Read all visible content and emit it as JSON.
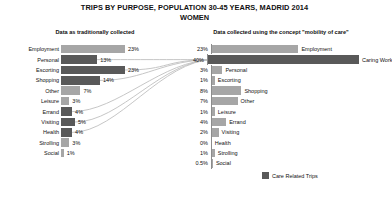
{
  "title": {
    "main": "TRIPS BY PURPOSE, POPULATION 30-45 YEARS, MADRID 2014",
    "sub": "WOMEN"
  },
  "panels": {
    "left_heading": "Data as traditionally collected",
    "right_heading": "Data collected using the concept \"mobility of care\""
  },
  "legend": {
    "label": "Care Related Trips",
    "swatch_color": "#595959"
  },
  "colors": {
    "regular": "#a6a6a6",
    "care": "#595959",
    "connector": "#bfbfbf",
    "axis": "#8c8c8c"
  },
  "chart_data": {
    "type": "bar",
    "xlabel": "",
    "ylabel": "",
    "xlim": [
      0,
      40
    ],
    "grid": false,
    "legend_position": "bottom-right",
    "panels": [
      {
        "name": "Data as traditionally collected",
        "orientation": "horizontal-bar",
        "label_side": "left",
        "categories": [
          "Employment",
          "Personal",
          "Escorting",
          "Shopping",
          "Other",
          "Leisure",
          "Errand",
          "Visiting",
          "Health",
          "Strolling",
          "Social"
        ],
        "values": [
          23,
          13,
          23,
          14,
          7,
          3,
          4,
          5,
          4,
          3,
          1
        ],
        "value_labels": [
          "23%",
          "13%",
          "23%",
          "14%",
          "7%",
          "3%",
          "4%",
          "5%",
          "4%",
          "3%",
          "1%"
        ],
        "care_related": [
          false,
          true,
          true,
          true,
          false,
          false,
          true,
          true,
          true,
          false,
          false
        ]
      },
      {
        "name": "Data collected using the concept \"mobility of care\"",
        "orientation": "horizontal-bar",
        "label_side": "right",
        "categories": [
          "Employment",
          "Caring Work",
          "Personal",
          "Escorting",
          "Shopping",
          "Other",
          "Leisure",
          "Errand",
          "Visiting",
          "Health",
          "Strolling",
          "Social"
        ],
        "values": [
          23,
          40,
          3,
          1,
          8,
          7,
          1,
          4,
          2,
          0,
          1,
          0.5
        ],
        "value_labels": [
          "23%",
          "40%",
          "3%",
          "1%",
          "8%",
          "7%",
          "1%",
          "4%",
          "2%",
          "0%",
          "1%",
          "0.5%"
        ],
        "care_related": [
          false,
          true,
          false,
          false,
          false,
          false,
          false,
          false,
          false,
          false,
          false,
          false
        ]
      }
    ]
  },
  "left_rows": [
    {
      "label": "Employment",
      "value_label": "23%",
      "value": 23,
      "care": false
    },
    {
      "label": "Personal",
      "value_label": "13%",
      "value": 13,
      "care": true
    },
    {
      "label": "Escorting",
      "value_label": "23%",
      "value": 23,
      "care": true
    },
    {
      "label": "Shopping",
      "value_label": "14%",
      "value": 14,
      "care": true
    },
    {
      "label": "Other",
      "value_label": "7%",
      "value": 7,
      "care": false
    },
    {
      "label": "Leisure",
      "value_label": "3%",
      "value": 3,
      "care": false
    },
    {
      "label": "Errand",
      "value_label": "4%",
      "value": 4,
      "care": true
    },
    {
      "label": "Visiting",
      "value_label": "5%",
      "value": 5,
      "care": true
    },
    {
      "label": "Health",
      "value_label": "4%",
      "value": 4,
      "care": true
    },
    {
      "label": "Strolling",
      "value_label": "3%",
      "value": 3,
      "care": false
    },
    {
      "label": "Social",
      "value_label": "1%",
      "value": 1,
      "care": false
    }
  ],
  "right_rows": [
    {
      "label": "Employment",
      "value_label": "23%",
      "value": 23,
      "care": false
    },
    {
      "label": "Caring Work",
      "value_label": "40%",
      "value": 40,
      "care": true
    },
    {
      "label": "Personal",
      "value_label": "3%",
      "value": 3,
      "care": false
    },
    {
      "label": "Escorting",
      "value_label": "1%",
      "value": 1,
      "care": false
    },
    {
      "label": "Shopping",
      "value_label": "8%",
      "value": 8,
      "care": false
    },
    {
      "label": "Other",
      "value_label": "7%",
      "value": 7,
      "care": false
    },
    {
      "label": "Leisure",
      "value_label": "1%",
      "value": 1,
      "care": false
    },
    {
      "label": "Errand",
      "value_label": "4%",
      "value": 4,
      "care": false
    },
    {
      "label": "Visiting",
      "value_label": "2%",
      "value": 2,
      "care": false
    },
    {
      "label": "Health",
      "value_label": "0%",
      "value": 0,
      "care": false
    },
    {
      "label": "Strolling",
      "value_label": "1%",
      "value": 1,
      "care": false
    },
    {
      "label": "Social",
      "value_label": "0.5%",
      "value": 0.5,
      "care": false
    }
  ]
}
